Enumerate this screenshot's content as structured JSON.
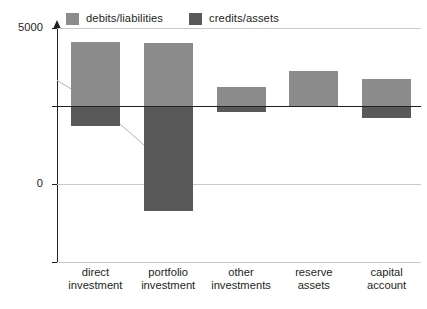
{
  "chart_data": {
    "type": "bar",
    "title": "",
    "subtitle": "",
    "xlabel": "",
    "ylabel": "",
    "categories": [
      "direct investment",
      "portfolio investment",
      "other investments",
      "reserve assets",
      "capital account"
    ],
    "category_lines": [
      [
        "direct",
        "investment"
      ],
      [
        "portfolio",
        "investment"
      ],
      [
        "other",
        "investments"
      ],
      [
        "reserve",
        "assets"
      ],
      [
        "capital",
        "account"
      ]
    ],
    "series": [
      {
        "name": "debits/liabilities",
        "color": "#8c8c8c",
        "values": [
          4100,
          4050,
          1250,
          2250,
          1700
        ]
      },
      {
        "name": "credits/assets",
        "color": "#595959",
        "values": [
          -1250,
          -6700,
          -400,
          0,
          -800
        ]
      }
    ],
    "ylim": [
      -10000,
      5000
    ],
    "yticks": [
      5000,
      0,
      -5000,
      -10000
    ],
    "ytick_labels": [
      "5000",
      "0",
      "-5000",
      "-10 000"
    ],
    "grid": true,
    "grid_color": "#c9c9c9",
    "zero_line_color": "#231f20",
    "legend_position": "top-left",
    "stacked": "zero-baseline",
    "annotations": [
      {
        "name": "faint-trend-line",
        "visible": true,
        "color": "#b3b3b3",
        "points": [
          [
            0,
            1650
          ],
          [
            128,
            -5240
          ]
        ]
      }
    ]
  },
  "legend": {
    "items": [
      {
        "label": "debits/liabilities",
        "swatch": "#8c8c8c"
      },
      {
        "label": "credits/assets",
        "swatch": "#595959"
      }
    ]
  },
  "axis": {
    "y_labels": [
      "5000",
      "0",
      "-5000",
      "-10 000"
    ]
  }
}
